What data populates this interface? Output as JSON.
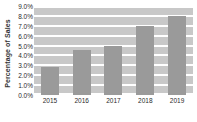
{
  "chart_data": {
    "type": "bar",
    "title": "",
    "subtitle": "",
    "xlabel": "",
    "ylabel": "Percentage of Sales",
    "categories": [
      "2015",
      "2016",
      "2017",
      "2018",
      "2019"
    ],
    "values": [
      2.8,
      4.6,
      5.0,
      7.0,
      8.0
    ],
    "series": [
      {
        "name": "Percentage of Sales",
        "values": [
          2.8,
          4.6,
          5.0,
          7.0,
          8.0
        ]
      }
    ],
    "ylim": [
      0.0,
      9.0
    ],
    "ytick_values": [
      0.0,
      1.0,
      2.0,
      3.0,
      4.0,
      5.0,
      6.0,
      7.0,
      8.0,
      9.0
    ],
    "ytick_labels": [
      "0.0%",
      "1.0%",
      "2.0%",
      "3.0%",
      "4.0%",
      "5.0%",
      "6.0%",
      "7.0%",
      "8.0%",
      "9.0%"
    ],
    "xtick_labels": [
      "2015",
      "2016",
      "2017",
      "2018",
      "2019"
    ],
    "grid": true,
    "grid_orientation": "horizontal",
    "legend": false,
    "legend_position": "none",
    "annotations": [],
    "colors": {
      "bar": "#9a9a9a",
      "plot_background": "#c8c8c8",
      "gridline": "#ffffff",
      "figure_background": "#ffffff",
      "tick_label": "#2b2b2b",
      "axis_title": "#333333"
    }
  }
}
